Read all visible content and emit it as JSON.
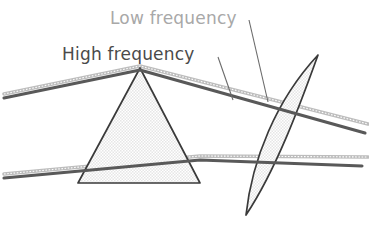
{
  "figure": {
    "title_alt": "Prism and lens dispersion diagram",
    "background_color": "#ffffff",
    "width": 369,
    "height": 229,
    "labels": {
      "high_frequency": "High frequency",
      "low_frequency": "Low frequency"
    },
    "colors": {
      "high_frequency_ray": "#595959",
      "low_frequency_ray": "#b0b0b0",
      "optic_outline": "#3a3a3a",
      "optic_fill": "#f0f0f0",
      "leader_line": "#6b6b6b",
      "high_label_text": "#4a4a4a",
      "low_label_text": "#a8a8a8"
    },
    "elements": {
      "prism": {
        "name": "prism",
        "shape": "triangle",
        "points": "140,68 200,183 78,183"
      },
      "lens": {
        "name": "lens",
        "shape": "biconvex-lens",
        "tip_top": "318,55",
        "tip_bottom": "246,215"
      },
      "high_frequency_rays": [
        {
          "name": "upper-ray",
          "path": "M 4,98 L 140,70 L 365,133"
        },
        {
          "name": "lower-ray",
          "path": "M 4,178 L 200,160 L 362,166"
        }
      ],
      "low_frequency_rays": [
        {
          "name": "upper-ray",
          "path": "M 4,94 L 140,66 L 368,124"
        },
        {
          "name": "lower-ray",
          "path": "M 4,174 L 200,156 L 368,157"
        }
      ],
      "leader_lines": [
        {
          "name": "high-frequency-leader",
          "path": "M 218,57 L 233,100"
        },
        {
          "name": "low-frequency-leader",
          "path": "M 249,20 L 268,102"
        }
      ]
    }
  }
}
